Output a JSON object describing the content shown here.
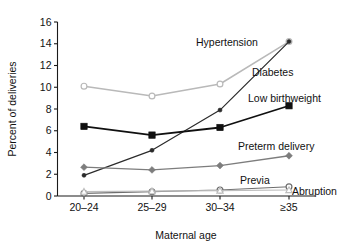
{
  "chart_data": {
    "type": "line",
    "title": "",
    "xlabel": "Maternal age",
    "ylabel": "Percent of deliveries",
    "categories": [
      "20–24",
      "25–29",
      "30–34",
      "≥35"
    ],
    "ylim": [
      0,
      16
    ],
    "yticks": [
      0,
      2,
      4,
      6,
      8,
      10,
      12,
      14,
      16
    ],
    "ytick_labels": [
      "0",
      "2",
      "4",
      "6",
      "8",
      "10",
      "12",
      "14",
      "16"
    ],
    "grid": false,
    "legend_position": "inline-annotations",
    "series": [
      {
        "name": "Hypertension",
        "values": [
          10.1,
          9.2,
          10.3,
          14.2
        ],
        "color": "#b9b9b9",
        "marker": "open-circle",
        "line_width": 1.5
      },
      {
        "name": "Diabetes",
        "values": [
          1.9,
          4.2,
          7.9,
          14.2
        ],
        "color": "#2b2b2b",
        "marker": "small-filled-circle",
        "line_width": 1.2
      },
      {
        "name": "Low birthweight",
        "values": [
          6.4,
          5.6,
          6.3,
          8.3
        ],
        "color": "#101010",
        "marker": "filled-square",
        "line_width": 1.8
      },
      {
        "name": "Preterm delivery",
        "values": [
          2.65,
          2.4,
          2.8,
          3.7
        ],
        "color": "#7d7d7d",
        "marker": "filled-diamond",
        "line_width": 1.3
      },
      {
        "name": "Previa",
        "values": [
          0.25,
          0.4,
          0.55,
          0.85
        ],
        "color": "#6e6e6e",
        "marker": "open-circle",
        "line_width": 1.2
      },
      {
        "name": "Abruption",
        "values": [
          0.4,
          0.45,
          0.5,
          0.55
        ],
        "color": "#bdbdbd",
        "marker": "open-triangle",
        "line_width": 1.2
      }
    ],
    "annotations": [
      {
        "text": "Hypertension",
        "x": 196,
        "y": 46
      },
      {
        "text": "Diabetes",
        "x": 252,
        "y": 76
      },
      {
        "text": "Low birthweight",
        "x": 248,
        "y": 102
      },
      {
        "text": "Preterm delivery",
        "x": 238,
        "y": 150
      },
      {
        "text": "Previa",
        "x": 240,
        "y": 184
      },
      {
        "text": "Abruption",
        "x": 292,
        "y": 195
      }
    ]
  },
  "axes": {
    "x_title": "Maternal age",
    "y_title": "Percent of deliveries"
  }
}
